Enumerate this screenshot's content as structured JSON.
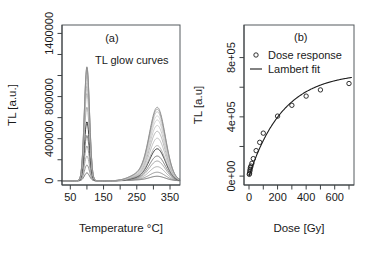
{
  "figure": {
    "background": "#ffffff",
    "width": 367,
    "height": 258
  },
  "chart_data": [
    {
      "id": "panel-a",
      "type": "line",
      "panel_tag": "(a)",
      "annotation": "TL glow curves",
      "title": "",
      "xlabel": "Temperature °C]",
      "ylabel": "TL [a.u.]",
      "xlim": [
        25,
        380
      ],
      "ylim": [
        -40000,
        1480000
      ],
      "xticks": [
        50,
        150,
        250,
        350
      ],
      "xticks_minor": [
        100,
        200,
        300
      ],
      "yticks": [
        0,
        400000,
        800000,
        1400000
      ],
      "ytick_labels": [
        "0",
        "400000",
        "800000",
        "1400000"
      ],
      "grid": false,
      "legend": "none",
      "series_description": "Thermoluminescence glow curves for increasing absorbed dose; each curve has two peaks near 100 °C and 310 °C.",
      "peak1_center": 100,
      "peak1_width": 11,
      "peak2_center": 312,
      "peak2_width": 34,
      "peak2_shoulder_center": 255,
      "peak2_shoulder_width": 40,
      "series": [
        {
          "name": "dose 1",
          "peak1": 75000,
          "peak2": 42000,
          "shoulder": 7000,
          "color": "#4f4f4f",
          "width": 0.8
        },
        {
          "name": "dose 2",
          "peak1": 150000,
          "peak2": 80000,
          "shoulder": 11000,
          "color": "#7a7a7a",
          "width": 0.8
        },
        {
          "name": "dose 3",
          "peak1": 235000,
          "peak2": 132000,
          "shoulder": 15000,
          "color": "#9a9a9a",
          "width": 0.8
        },
        {
          "name": "dose 4",
          "peak1": 330000,
          "peak2": 185000,
          "shoulder": 19000,
          "color": "#8a8a8a",
          "width": 0.8
        },
        {
          "name": "dose 5",
          "peak1": 430000,
          "peak2": 232000,
          "shoulder": 23000,
          "color": "#6f6f6f",
          "width": 0.9
        },
        {
          "name": "dose 6",
          "peak1": 560000,
          "peak2": 300000,
          "shoulder": 27000,
          "color": "#2e2e2e",
          "width": 1.0
        },
        {
          "name": "dose 7",
          "peak1": 700000,
          "peak2": 330000,
          "shoulder": 30000,
          "color": "#9d9d9d",
          "width": 0.8
        },
        {
          "name": "dose 8",
          "peak1": 830000,
          "peak2": 400000,
          "shoulder": 34000,
          "color": "#b0b0b0",
          "width": 0.8
        },
        {
          "name": "dose 9",
          "peak1": 900000,
          "peak2": 465000,
          "shoulder": 38000,
          "color": "#a5a5a5",
          "width": 0.8
        },
        {
          "name": "dose 10",
          "peak1": 935000,
          "peak2": 520000,
          "shoulder": 42000,
          "color": "#bcbcbc",
          "width": 0.8
        },
        {
          "name": "dose 11",
          "peak1": 990000,
          "peak2": 572000,
          "shoulder": 46000,
          "color": "#c4c4c4",
          "width": 0.8
        },
        {
          "name": "dose 12",
          "peak1": 1030000,
          "peak2": 610000,
          "shoulder": 50000,
          "color": "#cccccc",
          "width": 0.8
        },
        {
          "name": "dose 13",
          "peak1": 1060000,
          "peak2": 648000,
          "shoulder": 54000,
          "color": "#b6b6b6",
          "width": 0.8
        },
        {
          "name": "dose 14",
          "peak1": 1075000,
          "peak2": 672000,
          "shoulder": 57000,
          "color": "#9e9e9e",
          "width": 0.9
        },
        {
          "name": "dose 15",
          "peak1": 1085000,
          "peak2": 690000,
          "shoulder": 60000,
          "color": "#8c8c8c",
          "width": 0.9
        }
      ]
    },
    {
      "id": "panel-b",
      "type": "scatter",
      "panel_tag": "(b)",
      "title": "",
      "xlabel": "Dose [Gy]",
      "ylabel": "TL [a.u]",
      "xlim": [
        -35,
        735
      ],
      "ylim": [
        -60000,
        1020000
      ],
      "xticks": [
        0,
        200,
        400,
        600
      ],
      "xticks_minor": [
        100,
        300,
        500,
        700
      ],
      "yticks": [
        0,
        400000,
        800000
      ],
      "ytick_labels": [
        "0e+00",
        "4e+05",
        "8e+05"
      ],
      "yticks_minor": [
        200000,
        600000
      ],
      "grid": false,
      "legend": {
        "position": "top-left-inside",
        "entries": [
          {
            "label": "Dose response",
            "marker": "circle"
          },
          {
            "label": "Lambert fit",
            "marker": "line"
          }
        ]
      },
      "points": [
        {
          "x": 2,
          "y": 12000
        },
        {
          "x": 4,
          "y": 20000
        },
        {
          "x": 6,
          "y": 34000
        },
        {
          "x": 8,
          "y": 46000
        },
        {
          "x": 10,
          "y": 58000
        },
        {
          "x": 14,
          "y": 68000
        },
        {
          "x": 20,
          "y": 86000
        },
        {
          "x": 30,
          "y": 118000
        },
        {
          "x": 50,
          "y": 172000
        },
        {
          "x": 75,
          "y": 228000
        },
        {
          "x": 100,
          "y": 290000
        },
        {
          "x": 200,
          "y": 405000
        },
        {
          "x": 300,
          "y": 478000
        },
        {
          "x": 400,
          "y": 540000
        },
        {
          "x": 500,
          "y": 582000
        },
        {
          "x": 700,
          "y": 625000
        }
      ],
      "fit": {
        "name": "Lambert fit",
        "saturation": 700000,
        "rate": 0.0042,
        "description": "Saturating Lambert-type dose response curve rising steeply to ~6.3e+05 at 700 Gy."
      }
    }
  ]
}
